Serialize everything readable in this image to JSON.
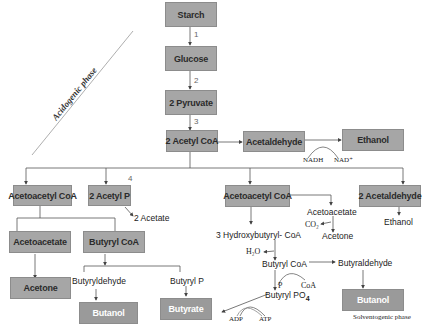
{
  "diagram": {
    "phases": {
      "acidogenic": "Acidogenic phase",
      "solventogenic": "Solventogenic phase"
    },
    "step_numbers": [
      "1",
      "2",
      "3",
      "4"
    ],
    "main_chain": [
      "Starch",
      "Glucose",
      "2 Pyruvate",
      "2 Acetyl CoA"
    ],
    "ethanol_branch": {
      "acetaldehyde": "Acetaldehyde",
      "ethanol": "Ethanol",
      "cofactor_in": "NADH",
      "cofactor_out": "NAD⁺"
    },
    "acidogenic_branch": {
      "acetoacetyl_coa": "Acetoacetyl CoA",
      "acetyl_p": "2 Acetyl P",
      "acetate": "2 Acetate",
      "acetoacetate": "Acetoacetate",
      "butyryl_coa": "Butyryl CoA",
      "acetone": "Acetone",
      "butyryldehyde": "Butyryldehyde",
      "butyryl_p": "Butyryl P",
      "butanol": "Butanol",
      "butyrate": "Butyrate"
    },
    "solventogenic_branch": {
      "acetoacetyl_coa": "Acetoacetyl CoA",
      "acetaldehyde2": "2 Acetaldehyde",
      "ethanol": "Ethanol",
      "acetoacetate": "Acetoacetate",
      "co2": "CO₂",
      "acetone": "Acetone",
      "hydroxybutyryl": "3 Hydroxybutyryl- CoA",
      "h2o": "H₂O",
      "butyryl_coa": "Butyryl CoA",
      "butyraldehyde": "Butyraldehyde",
      "p": "P",
      "coa": "CoA",
      "butyryl_po4": "Butyryl PO",
      "po4_sub": "4",
      "adp": "ADP",
      "atp": "ATP",
      "butanol": "Butanol"
    },
    "colors": {
      "box_fill": "#a6a6a6",
      "box_border": "#8c8c8c",
      "line": "#555555",
      "background": "#ffffff"
    }
  }
}
